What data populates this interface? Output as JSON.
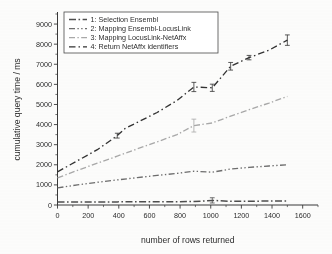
{
  "figure": {
    "background_color": "#fdfdfc",
    "ink_color": "#2e2e2e"
  },
  "axes": {
    "x_title": "number of rows returned",
    "y_title": "cumulative query time / ms",
    "x_ticks": [
      "0",
      "200",
      "400",
      "600",
      "800",
      "1000",
      "1200",
      "1400",
      "1600"
    ],
    "y_ticks": [
      "0",
      "1000",
      "2000",
      "3000",
      "4000",
      "5000",
      "6000",
      "7000",
      "8000",
      "9000"
    ]
  },
  "legend": {
    "items": [
      {
        "label": "1: Selection Ensembl",
        "color": "#4f4f4f",
        "dash": "7,2.5,1.6,2.5"
      },
      {
        "label": "2: Mapping Ensembl-LocusLink",
        "color": "#6d6d6d",
        "dash": "6,2.4,1.4,2.4,1.4,2.4"
      },
      {
        "label": "3: Mapping LocusLink-NetAffx",
        "color": "#a8a8a8",
        "dash": "6,2.4,1.4,2.4"
      },
      {
        "label": "4: Return NetAffx identifiers",
        "color": "#343434",
        "dash": "6.5,3,1.5,3"
      }
    ]
  },
  "chart_data": {
    "type": "line",
    "title": "",
    "xlabel": "number of rows returned",
    "ylabel": "cumulative query time / ms",
    "xlim": [
      0,
      1700
    ],
    "ylim": [
      0,
      9500
    ],
    "xticks": [
      0,
      200,
      400,
      600,
      800,
      1000,
      1200,
      1400,
      1600
    ],
    "yticks": [
      0,
      1000,
      2000,
      3000,
      4000,
      5000,
      6000,
      7000,
      8000,
      9000
    ],
    "grid": false,
    "legend_position": "upper-left-inside",
    "error_bars": true,
    "series": [
      {
        "name": "1: Selection Ensembl",
        "color": "#4f4f4f",
        "x": [
          0,
          130,
          260,
          390,
          520,
          650,
          780,
          890,
          1010,
          1130,
          1250,
          1380,
          1500
        ],
        "y": [
          150,
          150,
          155,
          155,
          160,
          160,
          165,
          170,
          230,
          185,
          190,
          195,
          200
        ],
        "yerr": [
          0,
          0,
          0,
          0,
          0,
          0,
          0,
          0,
          130,
          0,
          0,
          0,
          0
        ]
      },
      {
        "name": "2: Mapping Ensembl-LocusLink",
        "color": "#6d6d6d",
        "x": [
          0,
          130,
          260,
          390,
          520,
          650,
          780,
          890,
          1010,
          1130,
          1250,
          1380,
          1500
        ],
        "y": [
          850,
          1000,
          1130,
          1250,
          1360,
          1470,
          1570,
          1680,
          1630,
          1790,
          1870,
          1940,
          2000
        ],
        "yerr": [
          0,
          0,
          0,
          0,
          0,
          0,
          0,
          0,
          0,
          0,
          0,
          0,
          0
        ]
      },
      {
        "name": "3: Mapping LocusLink-NetAffx",
        "color": "#a8a8a8",
        "x": [
          0,
          130,
          260,
          390,
          520,
          650,
          780,
          890,
          1010,
          1130,
          1250,
          1380,
          1500
        ],
        "y": [
          1350,
          1720,
          2080,
          2430,
          2790,
          3140,
          3500,
          3950,
          4080,
          4420,
          4740,
          5070,
          5400
        ],
        "yerr": [
          0,
          0,
          0,
          0,
          0,
          0,
          0,
          320,
          0,
          0,
          0,
          0,
          0
        ]
      },
      {
        "name": "4: Return NetAffx identifiers",
        "color": "#343434",
        "x": [
          0,
          130,
          260,
          390,
          440,
          650,
          780,
          890,
          1010,
          1130,
          1250,
          1380,
          1500
        ],
        "y": [
          1650,
          2200,
          2750,
          3450,
          3800,
          4600,
          5200,
          5870,
          5830,
          6900,
          7330,
          7700,
          8200
        ],
        "yerr": [
          0,
          0,
          0,
          120,
          0,
          0,
          0,
          230,
          180,
          190,
          110,
          0,
          260
        ]
      }
    ]
  }
}
